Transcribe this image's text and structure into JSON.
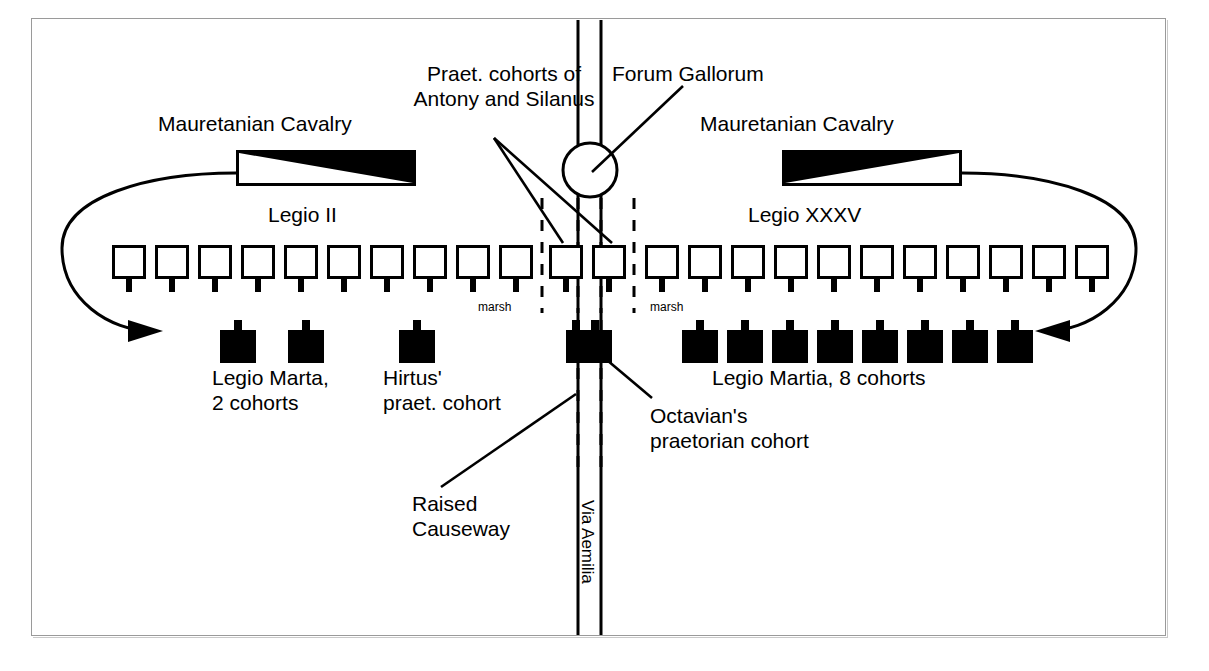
{
  "diagram": {
    "title_visible": false,
    "background_color": "#ffffff",
    "ink_color": "#000000",
    "frame_color": "#9a9a9a"
  },
  "labels": {
    "praet_cohorts": "Praet. cohorts of\nAntony and Silanus",
    "forum_gallorum": "Forum Gallorum",
    "cavalry_left": "Mauretanian Cavalry",
    "cavalry_right": "Mauretanian Cavalry",
    "legio_ii": "Legio II",
    "legio_xxxv": "Legio XXXV",
    "marsh_left": "marsh",
    "marsh_right": "marsh",
    "legio_marta": "Legio Marta,\n2 cohorts",
    "hirtus": "Hirtus'\npraet. cohort",
    "legio_martia": "Legio Martia, 8 cohorts",
    "octavian": "Octavian's\npraetorian cohort",
    "raised_causeway": "Raised\nCauseway",
    "via_aemilia": "Via Aemilia"
  },
  "chart_data": {
    "type": "diagram",
    "map_elements": {
      "road": {
        "name": "Via Aemilia",
        "orientation": "vertical",
        "x_center": 590
      },
      "settlement": {
        "name": "Forum Gallorum",
        "marker": "open-circle",
        "x": 590,
        "y": 170
      },
      "terrain": [
        {
          "name": "marsh",
          "side": "left",
          "x": 505,
          "y": 305
        },
        {
          "name": "marsh",
          "side": "right",
          "x": 665,
          "y": 305
        }
      ],
      "causeway": {
        "name": "Raised Causeway",
        "style": "dashed",
        "orientation": "vertical"
      }
    },
    "formations": [
      {
        "name": "Mauretanian Cavalry",
        "side": "left",
        "symbol": "cavalry-box",
        "fill": "triangle-upper-right",
        "count": 1
      },
      {
        "name": "Legio II",
        "side": "left",
        "symbol": "white-unit-box",
        "count": 10,
        "line": "front"
      },
      {
        "name": "Praet. cohorts of Antony and Silanus",
        "side": "center",
        "symbol": "white-unit-box",
        "count": 2,
        "line": "front"
      },
      {
        "name": "Legio XXXV",
        "side": "right",
        "symbol": "white-unit-box",
        "count": 11,
        "line": "front"
      },
      {
        "name": "Mauretanian Cavalry",
        "side": "right",
        "symbol": "cavalry-box",
        "fill": "triangle-upper-left",
        "count": 1
      },
      {
        "name": "Legio Marta, 2 cohorts",
        "side": "left",
        "symbol": "black-unit-box",
        "count": 2,
        "line": "rear"
      },
      {
        "name": "Hirtus' praet. cohort",
        "side": "left",
        "symbol": "black-unit-box",
        "count": 1,
        "line": "rear"
      },
      {
        "name": "Octavian's praetorian cohort",
        "side": "center",
        "symbol": "black-unit-box-wide",
        "count": 1,
        "line": "rear"
      },
      {
        "name": "Legio Martia, 8 cohorts",
        "side": "right",
        "symbol": "black-unit-box",
        "count": 8,
        "line": "rear"
      }
    ],
    "movement_arrows": [
      {
        "name": "left-flanking-arrow",
        "from": "left cavalry",
        "direction": "sweep-around-left-to-right"
      },
      {
        "name": "right-flanking-arrow",
        "from": "right cavalry",
        "direction": "sweep-around-right-to-left"
      }
    ]
  }
}
